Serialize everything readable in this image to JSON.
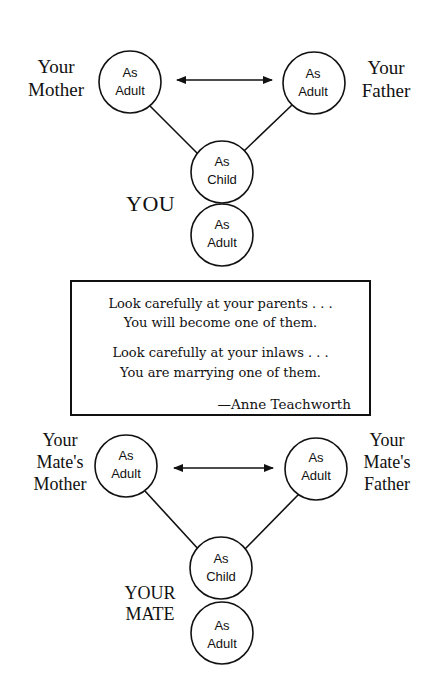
{
  "top_diagram": {
    "mother_label": [
      "Your",
      "Mother"
    ],
    "father_label": [
      "Your",
      "Father"
    ],
    "self_label": "YOU",
    "nodes": {
      "mother": [
        "As",
        "Adult"
      ],
      "father": [
        "As",
        "Adult"
      ],
      "child": [
        "As",
        "Child"
      ],
      "adult": [
        "As",
        "Adult"
      ]
    }
  },
  "quote": {
    "line1": "Look carefully at your parents . . .",
    "line2": "You will become one of them.",
    "line3": "Look carefully at your inlaws . . .",
    "line4": "You are marrying one of them.",
    "author": "—Anne Teachworth"
  },
  "bottom_diagram": {
    "mother_label": [
      "Your",
      "Mate's",
      "Mother"
    ],
    "father_label": [
      "Your",
      "Mate's",
      "Father"
    ],
    "self_label": [
      "YOUR",
      "MATE"
    ],
    "nodes": {
      "mother": [
        "As",
        "Adult"
      ],
      "father": [
        "As",
        "Adult"
      ],
      "child": [
        "As",
        "Child"
      ],
      "adult": [
        "As",
        "Adult"
      ]
    }
  },
  "colors": {
    "ink": "#111111",
    "paper": "#ffffff"
  }
}
